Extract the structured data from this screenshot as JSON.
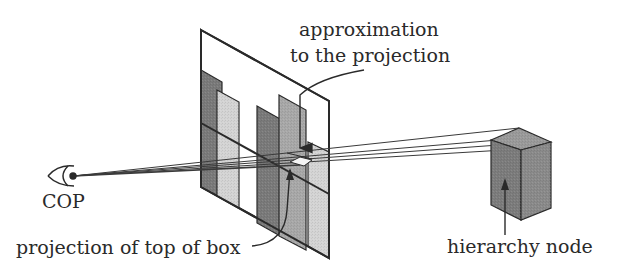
{
  "diagram": {
    "labels": {
      "approx_line1": "approximation",
      "approx_line2": "to the projection",
      "cop": "COP",
      "top_projection": "projection of top of box",
      "node": "hierarchy node"
    },
    "colors": {
      "stroke": "#2a2a2a",
      "bar_dark": "#7a7a7a",
      "bar_medium": "#a8a8a8",
      "bar_light": "#d4d4d4",
      "box_side": "#8a8a8a",
      "box_front": "#7c7c7c",
      "box_top": "#9a9a9a",
      "plane": "#ffffff"
    },
    "elements": [
      {
        "name": "center-of-projection",
        "label": "COP"
      },
      {
        "name": "image-plane",
        "label": ""
      },
      {
        "name": "hierarchy-node-box",
        "label": "hierarchy node"
      },
      {
        "name": "projection-rays",
        "count": 4
      }
    ]
  }
}
